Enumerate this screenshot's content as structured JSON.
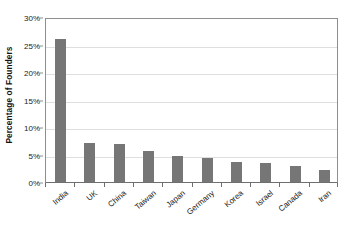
{
  "chart_data": {
    "type": "bar",
    "title": "",
    "subtitle": "",
    "xlabel": "",
    "ylabel": "Percentage of Founders",
    "categories": [
      "India",
      "UK",
      "China",
      "Taiwan",
      "Japan",
      "Germany",
      "Korea",
      "Israel",
      "Canada",
      "Iran"
    ],
    "values": [
      26.0,
      7.1,
      7.0,
      5.6,
      4.7,
      4.4,
      3.7,
      3.4,
      2.9,
      2.2
    ],
    "series": [
      {
        "name": "Percentage of Founders",
        "values": [
          26.0,
          7.1,
          7.0,
          5.6,
          4.7,
          4.4,
          3.7,
          3.4,
          2.9,
          2.2
        ]
      }
    ],
    "ylim": [
      0,
      30
    ],
    "ytick_values": [
      0,
      5,
      10,
      15,
      20,
      25,
      30
    ],
    "ytick_labels": [
      "0%",
      "5%",
      "10%",
      "15%",
      "20%",
      "25%",
      "30%"
    ],
    "grid": true,
    "grid_axis": "y",
    "legend": false,
    "legend_position": "none",
    "bar_color": "#767676",
    "grid_color": "#dedede",
    "axis_color": "#8e8e8e",
    "background_color": "#ffffff",
    "xtick_label_rotation": -40,
    "annotations": []
  }
}
